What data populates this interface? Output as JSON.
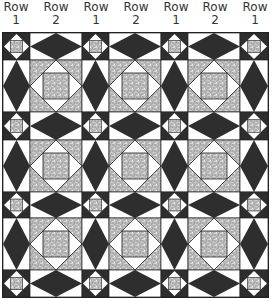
{
  "column_labels": [
    {
      "word": "Row",
      "num": "1",
      "cx": 16
    },
    {
      "word": "Row",
      "num": "2",
      "cx": 56
    },
    {
      "word": "Row",
      "num": "1",
      "cx": 96
    },
    {
      "word": "Row",
      "num": "2",
      "cx": 136
    },
    {
      "word": "Row",
      "num": "1",
      "cx": 176
    },
    {
      "word": "Row",
      "num": "2",
      "cx": 215
    },
    {
      "word": "Row",
      "num": "1",
      "cx": 255
    }
  ],
  "colors": {
    "dark": "#2e2e2e",
    "light": "#ffffff",
    "speckle_base": "#bdbdbd",
    "outline": "#222222"
  },
  "grid": {
    "col_widths": [
      27,
      52,
      27,
      52,
      27,
      52,
      28
    ],
    "row_heights": [
      27,
      52,
      28,
      52,
      26,
      52,
      27
    ],
    "pattern": "alternating small square-in-square blocks (dark) and large square-in-square blocks (speckled), separated by dark diamond sashing on white"
  }
}
